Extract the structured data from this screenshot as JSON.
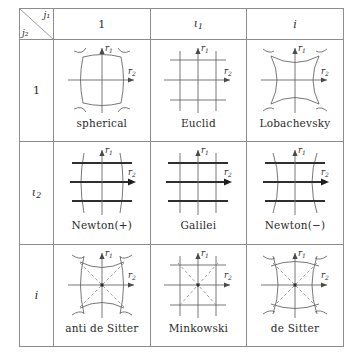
{
  "figure": {
    "kind": "table-of-geometries",
    "corner_header": {
      "column_var": "j₁",
      "row_var": "j₂"
    },
    "columns": [
      {
        "id": "col-1",
        "label": "1",
        "italic": false
      },
      {
        "id": "col-iota1",
        "label": "ι",
        "sub": "1",
        "italic": true
      },
      {
        "id": "col-i",
        "label": "i",
        "italic": true
      }
    ],
    "rows": [
      {
        "id": "row-1",
        "label": "1",
        "italic": false
      },
      {
        "id": "row-iota2",
        "label": "ι",
        "sub": "2",
        "italic": true
      },
      {
        "id": "row-i",
        "label": "i",
        "italic": true
      }
    ],
    "axis_labels": {
      "vertical": "r",
      "vertical_sub": "1",
      "horizontal": "r",
      "horizontal_sub": "2"
    },
    "cells": [
      {
        "id": "cell-spherical",
        "row": "1",
        "col": "1",
        "caption": "spherical",
        "diagram": "sphere-grid",
        "h_style": "thin-curved-out",
        "v_style": "curved-out",
        "diagonals": false
      },
      {
        "id": "cell-euclid",
        "row": "1",
        "col": "ι₁",
        "caption": "Euclid",
        "diagram": "square-grid",
        "h_style": "thin-straight",
        "v_style": "straight",
        "diagonals": false
      },
      {
        "id": "cell-lobachevsky",
        "row": "1",
        "col": "i",
        "caption": "Lobachevsky",
        "diagram": "hyperbolic-grid",
        "h_style": "thin-curved-in",
        "v_style": "curved-in",
        "diagonals": false
      },
      {
        "id": "cell-newton-plus",
        "row": "ι₂",
        "col": "1",
        "caption": "Newton(+)",
        "diagram": "newton-plus-grid",
        "h_style": "bold-straight",
        "v_style": "curved-out",
        "diagonals": false
      },
      {
        "id": "cell-galilei",
        "row": "ι₂",
        "col": "ι₁",
        "caption": "Galilei",
        "diagram": "galilei-grid",
        "h_style": "bold-straight",
        "v_style": "straight",
        "diagonals": false
      },
      {
        "id": "cell-newton-minus",
        "row": "ι₂",
        "col": "i",
        "caption": "Newton(−)",
        "diagram": "newton-minus-grid",
        "h_style": "bold-straight",
        "v_style": "curved-in",
        "diagonals": false
      },
      {
        "id": "cell-anti-de-sitter",
        "row": "i",
        "col": "1",
        "caption": "anti de Sitter",
        "diagram": "ads-grid",
        "h_style": "thin-curved-in",
        "v_style": "curved-out",
        "diagonals": true
      },
      {
        "id": "cell-minkowski",
        "row": "i",
        "col": "ι₁",
        "caption": "Minkowski",
        "diagram": "minkowski-grid",
        "h_style": "thin-straight",
        "v_style": "straight",
        "diagonals": true
      },
      {
        "id": "cell-de-sitter",
        "row": "i",
        "col": "i",
        "caption": "de Sitter",
        "diagram": "ds-grid",
        "h_style": "thin-curved-out",
        "v_style": "curved-in",
        "diagonals": true
      }
    ],
    "colors": {
      "line": "#555555",
      "bold_line": "#2f2f2f",
      "axis": "#6a6a6a",
      "dashed": "#8a8a8a",
      "border": "#8d8d8d",
      "text": "#2b2b2b"
    }
  }
}
